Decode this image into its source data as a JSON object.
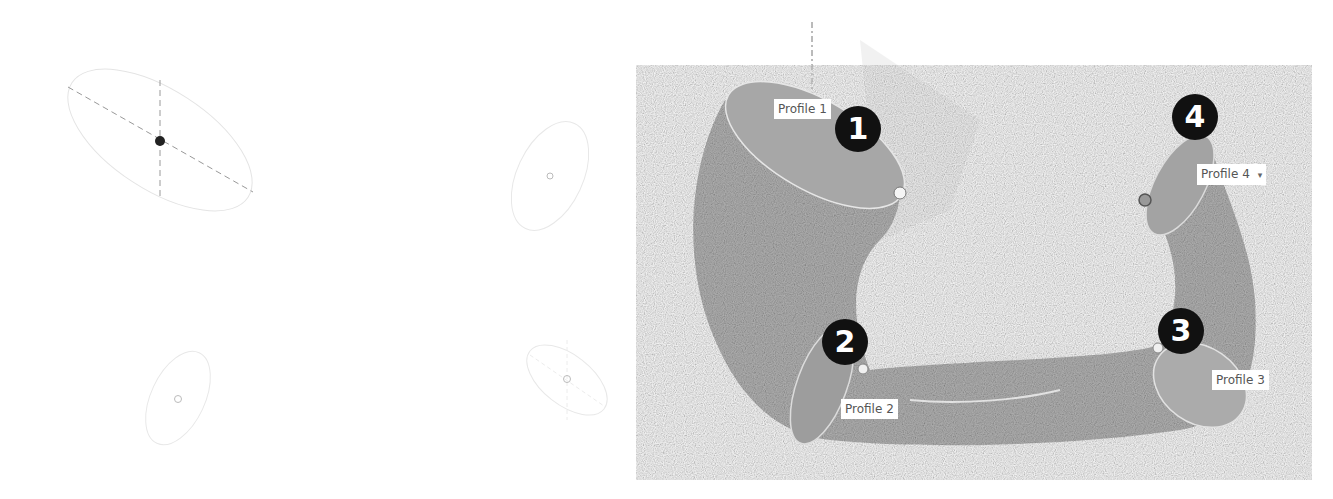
{
  "left_panel": {
    "description": "Four unlofted profile sketches (ellipses)",
    "profiles": [
      {
        "id": 1,
        "selected": true
      },
      {
        "id": 2,
        "selected": false
      },
      {
        "id": 3,
        "selected": false
      },
      {
        "id": 4,
        "selected": false
      }
    ]
  },
  "right_panel": {
    "description": "Lofted tube through four profiles",
    "labels": {
      "p1": "Profile 1",
      "p2": "Profile 2",
      "p3": "Profile 3",
      "p4": "Profile 4"
    },
    "badges": {
      "b1": "1",
      "b2": "2",
      "b3": "3",
      "b4": "4"
    },
    "dropdown_caret": "▾"
  },
  "colors": {
    "surface": "#b3b3b3",
    "profile_face": "#a6a6a6",
    "badge": "#111111",
    "sketch_line": "#dddddd"
  }
}
